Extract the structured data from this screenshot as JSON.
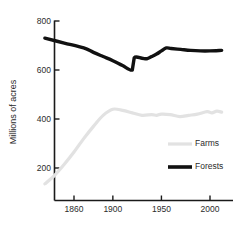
{
  "chart_data": {
    "type": "line",
    "title": "",
    "xlabel": "",
    "ylabel": "Millions of acres",
    "xlim": [
      1830,
      2012
    ],
    "ylim": [
      0,
      800
    ],
    "grid": false,
    "legend_position": "center-right",
    "xticks": [
      1860,
      1900,
      1950,
      2000
    ],
    "xticklabels": [
      "1860",
      "1900",
      "1950",
      "2000"
    ],
    "yticks": [
      200,
      400,
      600,
      800
    ],
    "yticklabels": [
      "200",
      "400",
      "600",
      "800"
    ],
    "series": [
      {
        "name": "Farms",
        "color": "#e2e2e2",
        "linewidth": 3.2,
        "x": [
          1830,
          1840,
          1850,
          1860,
          1870,
          1880,
          1890,
          1900,
          1910,
          1920,
          1930,
          1940,
          1945,
          1950,
          1959,
          1969,
          1978,
          1987,
          1997,
          2002,
          2007,
          2012
        ],
        "values": [
          135,
          170,
          215,
          265,
          320,
          370,
          415,
          440,
          435,
          425,
          415,
          418,
          415,
          420,
          418,
          410,
          415,
          420,
          430,
          425,
          432,
          428
        ]
      },
      {
        "name": "Forests",
        "color": "#111111",
        "linewidth": 3.4,
        "x": [
          1830,
          1850,
          1870,
          1880,
          1890,
          1900,
          1910,
          1920,
          1922,
          1930,
          1935,
          1940,
          1945,
          1950,
          1955,
          1960,
          1970,
          1980,
          1990,
          2000,
          2012
        ],
        "values": [
          730,
          710,
          690,
          672,
          655,
          638,
          618,
          600,
          650,
          648,
          646,
          655,
          665,
          678,
          690,
          688,
          684,
          680,
          678,
          678,
          680
        ]
      }
    ]
  },
  "legend": {
    "items": [
      {
        "label": "Farms",
        "color": "#e2e2e2"
      },
      {
        "label": "Forests",
        "color": "#111111"
      }
    ]
  },
  "axes": {
    "y_title": "Millions of acres"
  }
}
